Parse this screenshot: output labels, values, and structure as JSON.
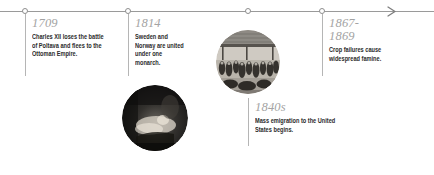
{
  "axis": {
    "arrow_icon": "arrow-right-icon",
    "tick_icon": "timeline-tick-icon",
    "ticks": [
      25,
      128,
      248,
      322
    ]
  },
  "entries": [
    {
      "year": "1709",
      "text": "Charles XII loses the battle of Poltava and flees to the Ottoman Empire."
    },
    {
      "year": "1814",
      "text": "Sweden and Norway are united under one monarch."
    },
    {
      "year": "1840s",
      "text": "Mass emigration to the United States begins."
    },
    {
      "year": "1867-\n1869",
      "text": "Crop failures cause widespread famine."
    }
  ],
  "photos": [
    {
      "name": "battle-engraving-photo"
    },
    {
      "name": "emigration-engraving-photo"
    }
  ],
  "colors": {
    "axis": "#9a9a9a",
    "connector": "#b5b5b5",
    "year_text": "#a3a3a3",
    "body_text": "#2b2b2b",
    "background": "#ffffff"
  }
}
